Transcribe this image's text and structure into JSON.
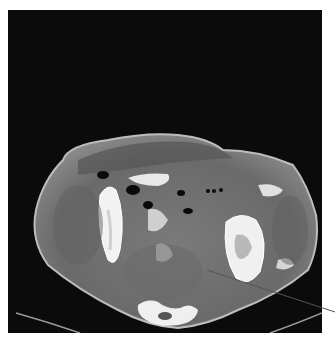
{
  "image": {
    "kind": "axial CT scan, pelvis",
    "background_color": "#0b0b0b",
    "page_color": "#ffffff"
  },
  "annotation": {
    "type": "pointer-line",
    "start": [
      207,
      270
    ],
    "end": [
      335,
      312
    ],
    "color": "#555555"
  },
  "colors": {
    "soft_tissue": "#6e6e6e",
    "fat": "#8a8a8a",
    "bone": "#f2f2f2",
    "air": "#0a0a0a",
    "skin_edge": "#b5b5b5"
  }
}
